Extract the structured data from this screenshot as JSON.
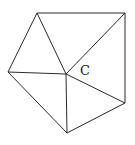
{
  "diagram": {
    "type": "pentagon-triangulation",
    "center_label": "C",
    "vertices": {
      "C": [
        66,
        74
      ],
      "top_left": [
        37,
        13
      ],
      "top_right": [
        125,
        13
      ],
      "right": [
        125,
        103
      ],
      "bottom": [
        67,
        133
      ],
      "left": [
        8,
        72
      ]
    },
    "edges": [
      [
        "top_left",
        "top_right"
      ],
      [
        "top_right",
        "right"
      ],
      [
        "right",
        "bottom"
      ],
      [
        "bottom",
        "left"
      ],
      [
        "left",
        "top_left"
      ],
      [
        "C",
        "top_left"
      ],
      [
        "C",
        "top_right"
      ],
      [
        "C",
        "right"
      ],
      [
        "C",
        "bottom"
      ],
      [
        "C",
        "left"
      ]
    ],
    "label_position": [
      80,
      75
    ],
    "stroke_color": "#2a2a2a"
  }
}
